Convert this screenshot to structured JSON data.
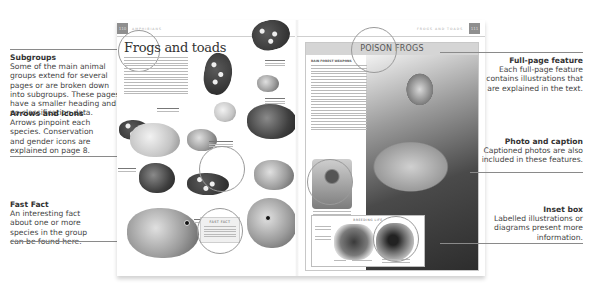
{
  "callouts": {
    "left": [
      {
        "title": "Subgroups",
        "text": "Some of the main animal groups extend for several pages or are broken down into subgroups. These pages have a smaller heading and no classification data."
      },
      {
        "title": "Arrows and icons",
        "text": "Arrows pinpoint each species. Conservation and gender icons are explained on page 8."
      },
      {
        "title": "Fast Fact",
        "text": "An interesting fact about one or more species in the group can be found here."
      }
    ],
    "right": [
      {
        "title": "Full-page feature",
        "text": "Each full-page feature contains illustrations that are explained in the text."
      },
      {
        "title": "Photo and caption",
        "text": "Captioned photos are also included in these features."
      },
      {
        "title": "Inset box",
        "text": "Labelled illustrations or diagrams present more information."
      }
    ]
  },
  "book": {
    "left_page": {
      "page_number": "110",
      "running_head": "AMPHIBIANS",
      "title": "Frogs and toads",
      "fact_box_heading": "FAST FACT"
    },
    "right_page": {
      "page_number": "111",
      "running_head": "FROGS AND TOADS",
      "feature_title": "POISON FROGS",
      "feature_subhead": "RAIN FOREST WEAPONS",
      "inset_heading": "BREEDING LIFE"
    }
  },
  "colors": {
    "page_number_box": "#8f8f8f",
    "rule": "#8a8a8a",
    "feature_bar": "#d5d5d5"
  }
}
